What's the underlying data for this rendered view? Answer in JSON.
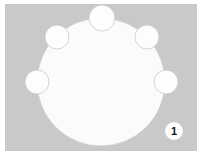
{
  "figure": {
    "caption": "",
    "background_color": "#c9c9c9",
    "page_color": "#ffffff",
    "shape_fill": "#fbfbfb",
    "shape_stroke": "#c0c0c0",
    "node_fill": "#fdfdfd",
    "node_stroke": "#c3c3c3"
  },
  "callout": {
    "label": "1",
    "text_color": "#101010",
    "background_color": "#ffffff",
    "border_color": "#d8d8d8",
    "cx": 174,
    "cy": 131,
    "r": 9
  },
  "main_shape": {
    "name": "large-circle",
    "cx": 101,
    "cy": 82,
    "r": 64
  },
  "nodes": [
    {
      "name": "node-top",
      "cx": 102,
      "cy": 18,
      "r": 13
    },
    {
      "name": "node-upper-left",
      "cx": 57,
      "cy": 37,
      "r": 12
    },
    {
      "name": "node-upper-right",
      "cx": 147,
      "cy": 37,
      "r": 12
    },
    {
      "name": "node-mid-left",
      "cx": 37,
      "cy": 82,
      "r": 12
    },
    {
      "name": "node-mid-right",
      "cx": 166,
      "cy": 82,
      "r": 12
    }
  ],
  "panel": {
    "x": 5,
    "y": 4,
    "width": 192,
    "height": 147
  }
}
